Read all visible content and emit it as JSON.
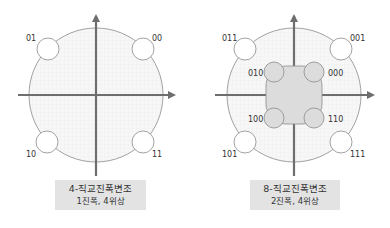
{
  "diagrams": [
    {
      "id": "4-qam",
      "caption_title": "4-직교진폭변조",
      "caption_sub": "1진폭, 4위상",
      "labels": [
        "01",
        "00",
        "10",
        "11"
      ]
    },
    {
      "id": "8-qam",
      "caption_title": "8-직교진폭변조",
      "caption_sub": "2진폭, 4위상",
      "outer_labels": [
        "011",
        "001",
        "101",
        "111"
      ],
      "inner_labels": [
        "010",
        "000",
        "100",
        "110"
      ]
    }
  ],
  "colors": {
    "axis": "#6e6e6e",
    "circle_stroke": "#8a8a8a",
    "grid_fill": "#f6f6f6",
    "inner_fill": "#dcdcdc",
    "caption_bg": "#e3e3e3"
  }
}
